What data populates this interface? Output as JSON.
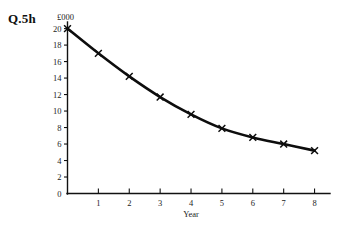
{
  "question_label": "Q.5h",
  "chart_data": {
    "type": "line",
    "title": "",
    "subtitle": "",
    "xlabel": "Year",
    "ylabel": "£000",
    "x": [
      0,
      1,
      2,
      3,
      4,
      5,
      6,
      7,
      8
    ],
    "values": [
      20.0,
      17.0,
      14.2,
      11.7,
      9.6,
      7.9,
      6.8,
      6.0,
      5.2
    ],
    "series": [
      {
        "name": "",
        "values": [
          20.0,
          17.0,
          14.2,
          11.7,
          9.6,
          7.9,
          6.8,
          6.0,
          5.2
        ]
      }
    ],
    "xlim": [
      0,
      8.5
    ],
    "ylim": [
      0,
      20.8
    ],
    "xticks": [
      1,
      2,
      3,
      4,
      5,
      6,
      7,
      8
    ],
    "xtick_labels": [
      "1",
      "2",
      "3",
      "4",
      "5",
      "6",
      "7",
      "8"
    ],
    "yticks": [
      0,
      2,
      4,
      6,
      8,
      10,
      12,
      14,
      16,
      18,
      20
    ],
    "ytick_labels": [
      "0",
      "2",
      "4",
      "6",
      "8",
      "10",
      "12",
      "14",
      "16",
      "18",
      "20"
    ],
    "grid": false,
    "legend": false,
    "legend_position": "none",
    "marker": "x",
    "line_color": "#0d0d0d",
    "marker_color": "#0d0d0d",
    "background_color": "#ffffff",
    "annotations": []
  },
  "axis": {
    "y_title": "£000",
    "x_title": "Year"
  }
}
